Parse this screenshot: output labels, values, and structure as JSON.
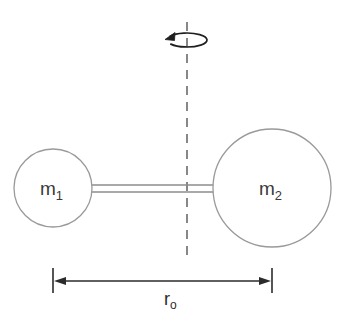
{
  "figure": {
    "kind": "physics-diagram",
    "background_color": "#ffffff",
    "width": 348,
    "height": 318
  },
  "axis": {
    "name": "rotation-axis",
    "style": "dashed vertical line",
    "color": "#555555",
    "x": 187,
    "y_top": 22,
    "y_bottom": 258
  },
  "rotation_indicator": {
    "name": "rotation-arrow",
    "style": "open ellipse with arrowhead",
    "direction": "counterclockwise-viewed-from-above",
    "color": "#1f1f1f",
    "center_x": 187,
    "center_y": 40,
    "rx": 20,
    "ry": 7
  },
  "masses": [
    {
      "id": "m1",
      "label": "m",
      "subscript": "1",
      "center_x": 53,
      "center_y": 188,
      "radius": 39,
      "stroke_color": "#9a9a9a",
      "fill_color": "#ffffff"
    },
    {
      "id": "m2",
      "label": "m",
      "subscript": "2",
      "center_x": 272,
      "center_y": 188,
      "radius": 59,
      "stroke_color": "#9a9a9a",
      "fill_color": "#ffffff"
    }
  ],
  "rod": {
    "name": "connecting-rod",
    "style": "double parallel line",
    "color": "#8d8d8d",
    "x_start": 92,
    "x_end": 214,
    "y_top": 185,
    "y_bottom": 192
  },
  "dimension": {
    "name": "separation-dimension",
    "label": "r",
    "subscript": "o",
    "full_label": "r₀",
    "color": "#2b2b2b",
    "line_y": 281,
    "x_start": 53,
    "x_end": 272,
    "tick_y_top": 268,
    "tick_y_bottom": 293,
    "label_x": 172,
    "label_y": 305
  }
}
